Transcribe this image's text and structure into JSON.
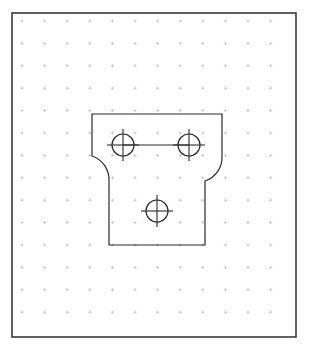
{
  "document": {
    "title": "Orthographic Sketch View",
    "view_label": "Front View",
    "units": "mm"
  },
  "canvas": {
    "width": 309,
    "height": 349,
    "background_color": "#ffffff",
    "border": {
      "name": "drawing-frame",
      "x": 12,
      "y": 13,
      "width": 284,
      "height": 324,
      "stroke_color": "#3a3a3a",
      "stroke_width": 1.6
    }
  },
  "grid": {
    "name": "dot-grid",
    "visible": true,
    "style": "cross-dots",
    "spacing_x": 22.6,
    "spacing_y": 22.4,
    "origin_x": 22,
    "origin_y": 21,
    "columns": 12,
    "rows": 14,
    "color": "#b9b9b9",
    "tick_length": 1.6,
    "stroke_width": 0.7
  },
  "geometry": {
    "name": "t-bracket-profile",
    "stroke_color": "#2b2b2b",
    "stroke_width": 1.2,
    "fill": "none",
    "description": "T-shaped bracket plate with two top mounting holes and one lower hole",
    "outline_points": [
      {
        "x": 92,
        "y": 114
      },
      {
        "x": 222,
        "y": 114
      },
      {
        "x": 222,
        "y": 156
      },
      {
        "x": 205,
        "y": 181
      },
      {
        "x": 205,
        "y": 245
      },
      {
        "x": 109,
        "y": 245
      },
      {
        "x": 109,
        "y": 181
      },
      {
        "x": 92,
        "y": 156
      }
    ],
    "fillets": [
      {
        "name": "left-fillet",
        "from_x": 92,
        "from_y": 156,
        "to_x": 109,
        "to_y": 181,
        "radius": 25,
        "sweep": 0
      },
      {
        "name": "right-fillet",
        "from_x": 222,
        "from_y": 156,
        "to_x": 205,
        "to_y": 181,
        "radius": 25,
        "sweep": 1
      }
    ],
    "top_width": 130,
    "stem_width": 96,
    "total_height": 131
  },
  "holes": [
    {
      "name": "hole-top-left",
      "cx": 123,
      "cy": 145,
      "r": 11,
      "crosshair_extension": 5,
      "label": "Hole 1"
    },
    {
      "name": "hole-top-right",
      "cx": 189,
      "cy": 145,
      "r": 11,
      "crosshair_extension": 5,
      "label": "Hole 2"
    },
    {
      "name": "hole-bottom-center",
      "cx": 157,
      "cy": 211,
      "r": 11,
      "crosshair_extension": 5,
      "label": "Hole 3"
    }
  ],
  "centerlines": [
    {
      "name": "centerline-top-holes",
      "x1": 123,
      "y1": 145,
      "x2": 189,
      "y2": 145,
      "stroke_color": "#2b2b2b",
      "stroke_width": 1.1
    }
  ],
  "styles": {
    "hole_stroke_color": "#2b2b2b",
    "hole_stroke_width": 1.2,
    "crosshair_stroke_width": 1.1
  }
}
